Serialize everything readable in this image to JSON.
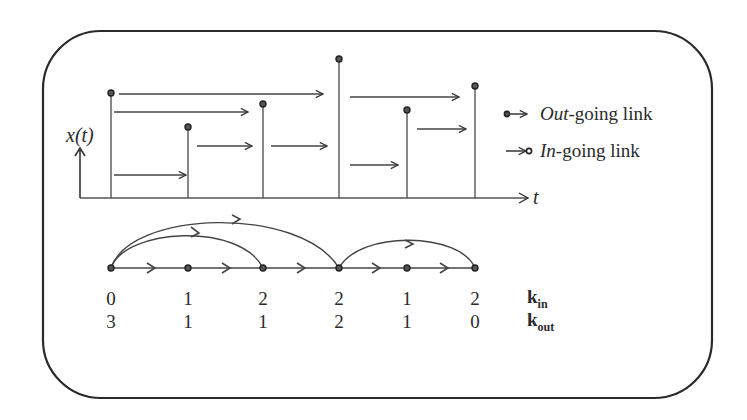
{
  "diagram": {
    "axis_label_y": "x(t)",
    "axis_label_x": "t",
    "legend": [
      {
        "marker": "out-going-link-marker",
        "label_italic": "Out",
        "label_rest": "-going link"
      },
      {
        "marker": "in-going-link-marker",
        "label_italic": "In",
        "label_rest": "-going link"
      }
    ],
    "time_series": {
      "stem_x": [
        111,
        188,
        263,
        339,
        407,
        475
      ],
      "stem_top_y": [
        93,
        127,
        104,
        59,
        110,
        86
      ]
    },
    "graph": {
      "nodes": 6,
      "links": [
        [
          0,
          1
        ],
        [
          0,
          2
        ],
        [
          0,
          3
        ],
        [
          1,
          2
        ],
        [
          2,
          3
        ],
        [
          3,
          4
        ],
        [
          3,
          5
        ],
        [
          4,
          5
        ]
      ]
    },
    "degrees": {
      "k_in_label": "k",
      "k_in_sub": "in",
      "k_out_label": "k",
      "k_out_sub": "out",
      "k_in": [
        "0",
        "1",
        "2",
        "2",
        "1",
        "2"
      ],
      "k_out": [
        "3",
        "1",
        "1",
        "2",
        "1",
        "0"
      ]
    },
    "colors": {
      "ink": "#333333",
      "border": "#2a2a2a",
      "background": "#ffffff"
    }
  }
}
